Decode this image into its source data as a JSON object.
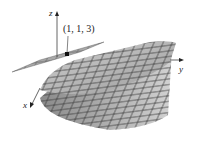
{
  "figure": {
    "axes": {
      "x_label": "x",
      "y_label": "y",
      "z_label": "z"
    },
    "point_label": "(1, 1, 3)",
    "colors": {
      "surface": "#b9b9b9",
      "surface_light": "#d6d6d6",
      "grid": "#3a3a3a",
      "plane": "#a8a8a8",
      "axis": "#555555"
    }
  }
}
